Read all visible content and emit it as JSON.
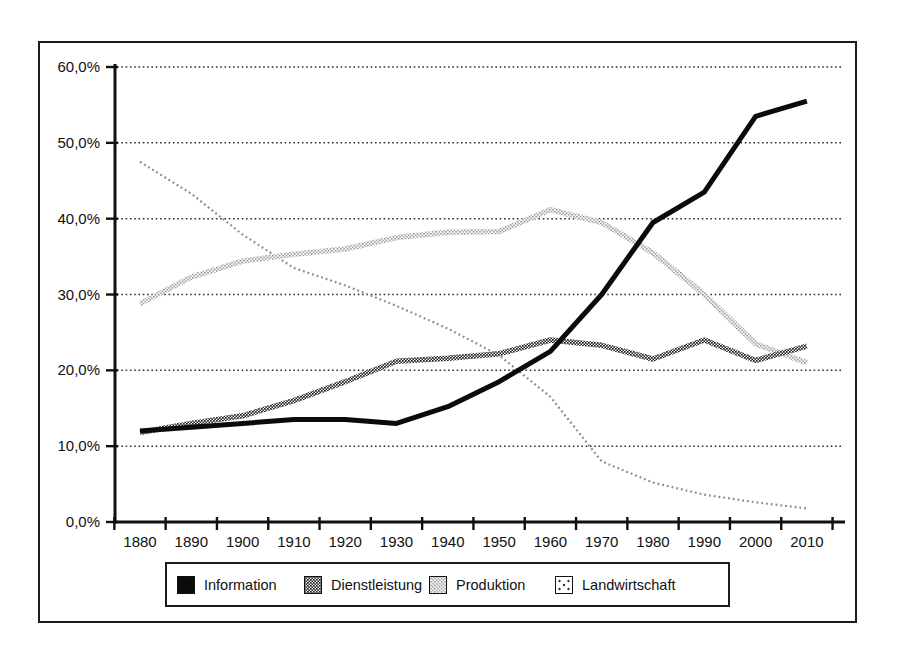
{
  "colors": {
    "ink": "#111111",
    "information_line": "#0b0b0b",
    "dienstleistung_texture": "#1f1f1f",
    "produktion_texture": "#7d7d7d",
    "landwirtschaft_dotted": "#8a8a8a"
  },
  "chart_data": {
    "type": "line",
    "title": "",
    "xlabel": "",
    "ylabel": "",
    "x": [
      1880,
      1890,
      1900,
      1910,
      1920,
      1930,
      1940,
      1950,
      1960,
      1970,
      1980,
      1990,
      2000,
      2010
    ],
    "x_tick_labels": [
      "1880",
      "1890",
      "1900",
      "1910",
      "1920",
      "1930",
      "1940",
      "1950",
      "1960",
      "1970",
      "1980",
      "1990",
      "2000",
      "2010"
    ],
    "y_axis": {
      "min": 0,
      "max": 60,
      "step": 10,
      "tick_labels": [
        "0,0%",
        "10,0%",
        "20,0%",
        "30,0%",
        "40,0%",
        "50,0%",
        "60,0%"
      ]
    },
    "grid": "horizontal dotted lines at every 10%",
    "legend_position": "bottom",
    "series": [
      {
        "name": "Information",
        "style": "solid-black-thick",
        "values": [
          12.0,
          12.5,
          13.0,
          13.5,
          13.5,
          13.0,
          15.2,
          18.5,
          22.5,
          30.0,
          39.5,
          43.5,
          53.5,
          55.5
        ]
      },
      {
        "name": "Dienstleistung",
        "style": "dark-crosshatch-thick",
        "values": [
          11.8,
          13.0,
          14.0,
          16.0,
          18.5,
          21.2,
          21.6,
          22.2,
          24.0,
          23.3,
          21.5,
          24.0,
          21.3,
          23.2
        ]
      },
      {
        "name": "Produktion",
        "style": "light-stipple-thick",
        "values": [
          28.8,
          32.3,
          34.4,
          35.3,
          36.0,
          37.5,
          38.2,
          38.3,
          41.2,
          39.5,
          35.5,
          30.0,
          23.5,
          21.0
        ]
      },
      {
        "name": "Landwirtschaft",
        "style": "fine-dotted-light",
        "values": [
          47.5,
          43.3,
          37.9,
          33.5,
          31.2,
          28.5,
          25.5,
          22.0,
          16.5,
          8.0,
          5.2,
          3.6,
          2.6,
          1.8
        ]
      }
    ]
  }
}
